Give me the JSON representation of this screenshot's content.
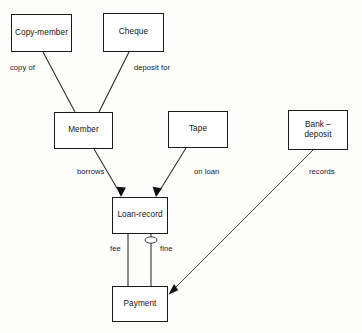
{
  "diagram": {
    "type": "entity-relationship-diagram",
    "background_color": "#fdfdfc",
    "line_color": "#2a2a2a",
    "box_border_color": "#1b1b1b",
    "text_color": "#141414",
    "entities": [
      {
        "id": "copy-member",
        "label": "Copy-member",
        "x": 11,
        "y": 14,
        "w": 61,
        "h": 38
      },
      {
        "id": "cheque",
        "label": "Cheque",
        "x": 103,
        "y": 13,
        "w": 61,
        "h": 39
      },
      {
        "id": "member",
        "label": "Member",
        "x": 54,
        "y": 112,
        "w": 59,
        "h": 37
      },
      {
        "id": "tape",
        "label": "Tape",
        "x": 168,
        "y": 111,
        "w": 60,
        "h": 37
      },
      {
        "id": "bank-deposit",
        "label": "Bank –\ndeposit",
        "x": 288,
        "y": 110,
        "w": 60,
        "h": 40
      },
      {
        "id": "loan-record",
        "label": "Loan-record",
        "x": 112,
        "y": 197,
        "w": 56,
        "h": 37
      },
      {
        "id": "payment",
        "label": "Payment",
        "x": 112,
        "y": 286,
        "w": 56,
        "h": 36
      }
    ],
    "relationships": [
      {
        "id": "copy-of",
        "label": "copy of",
        "from": "copy-member",
        "to": "member",
        "label_x": 10,
        "label_y": 63,
        "arrow": false
      },
      {
        "id": "deposit-for",
        "label": "deposit for",
        "from": "cheque",
        "to": "member",
        "label_x": 134,
        "label_y": 63,
        "arrow": false
      },
      {
        "id": "borrows",
        "label": "borrows",
        "from": "member",
        "to": "loan-record",
        "label_x": 77,
        "label_y": 167,
        "arrow": true
      },
      {
        "id": "on-loan",
        "label": "on loan",
        "from": "tape",
        "to": "loan-record",
        "label_x": 194,
        "label_y": 167,
        "arrow": true
      },
      {
        "id": "records",
        "label": "records",
        "from": "bank-deposit",
        "to": "payment",
        "label_x": 309,
        "label_y": 167,
        "arrow": true
      },
      {
        "id": "fee",
        "label": "fee",
        "from": "loan-record",
        "to": "payment",
        "label_x": 110,
        "label_y": 244,
        "arrow": false
      },
      {
        "id": "fine",
        "label": "fine",
        "from": "loan-record",
        "to": "payment",
        "label_x": 160,
        "label_y": 244,
        "arrow": false
      }
    ],
    "cardinality_markers": [
      {
        "id": "fine-optional-marker",
        "on_relationship": "fine",
        "shape": "ellipse",
        "cx": 151,
        "cy": 240,
        "rx": 6,
        "ry": 3.2
      }
    ]
  }
}
